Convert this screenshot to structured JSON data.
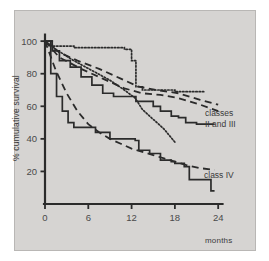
{
  "figure": {
    "background": "#ffffff",
    "panel_color": "#d6d4d2",
    "ink_color": "#2b2b2b"
  },
  "chart_data": {
    "type": "line",
    "title": "",
    "subtitle": "",
    "xlabel": "months",
    "ylabel": "% cumulative survival",
    "xlim": [
      0,
      25.5
    ],
    "ylim": [
      0,
      105
    ],
    "xticks": [
      0,
      6,
      12,
      18,
      24
    ],
    "xticklabels": [
      "0",
      "6",
      "12",
      "18",
      "24"
    ],
    "yticks": [
      20,
      40,
      60,
      80,
      100
    ],
    "yticklabels": [
      "20",
      "40",
      "60",
      "80",
      "100"
    ],
    "grid": false,
    "legend_position": "inline-annotations",
    "annotations": [
      {
        "text": "classes",
        "x": 22.3,
        "y": 62,
        "name": "classes-ii-and-iii-line1"
      },
      {
        "text": "II and III",
        "x": 22.3,
        "y": 57,
        "name": "classes-ii-and-iii-line2"
      },
      {
        "text": "class IV",
        "x": 22.2,
        "y": 21,
        "name": "class-iv-label"
      }
    ],
    "series": [
      {
        "name": "classes II and III — dashed upper",
        "style": "dashed",
        "step": false,
        "points": [
          [
            0,
            100
          ],
          [
            2.0,
            93
          ],
          [
            4.5,
            88
          ],
          [
            7.5,
            83
          ],
          [
            10.5,
            77
          ],
          [
            13.0,
            72
          ],
          [
            15.5,
            70
          ],
          [
            18.5,
            68
          ],
          [
            21.5,
            64
          ],
          [
            24.0,
            61
          ]
        ]
      },
      {
        "name": "classes II and III — dashed lower",
        "style": "dashed",
        "step": false,
        "points": [
          [
            0,
            100
          ],
          [
            2.0,
            90
          ],
          [
            5.0,
            83
          ],
          [
            8.0,
            77
          ],
          [
            11.0,
            71
          ],
          [
            13.5,
            68
          ],
          [
            16.0,
            67
          ],
          [
            18.5,
            65
          ],
          [
            21.5,
            61
          ],
          [
            24.0,
            57
          ]
        ]
      },
      {
        "name": "classes II and III — dotted plateau",
        "style": "dotted",
        "step": true,
        "points": [
          [
            0,
            100
          ],
          [
            1.0,
            97
          ],
          [
            4.0,
            96
          ],
          [
            9.0,
            96
          ],
          [
            11.0,
            95
          ],
          [
            12.0,
            88
          ],
          [
            12.6,
            72
          ],
          [
            13.5,
            70
          ],
          [
            16.0,
            70
          ],
          [
            18.0,
            69
          ],
          [
            20.5,
            69
          ],
          [
            22.0,
            69
          ]
        ]
      },
      {
        "name": "classes II and III — dotted descending",
        "style": "dotted",
        "step": false,
        "points": [
          [
            0,
            100
          ],
          [
            1.5,
            95
          ],
          [
            4.0,
            88
          ],
          [
            6.5,
            82
          ],
          [
            9.0,
            76
          ],
          [
            11.0,
            70
          ],
          [
            12.5,
            65
          ],
          [
            13.5,
            58
          ],
          [
            15.0,
            52
          ],
          [
            16.5,
            46
          ],
          [
            18.0,
            38
          ]
        ]
      },
      {
        "name": "classes II and III — solid step",
        "style": "solid",
        "step": true,
        "points": [
          [
            0,
            100
          ],
          [
            1.0,
            94
          ],
          [
            2.0,
            88
          ],
          [
            3.5,
            84
          ],
          [
            5.0,
            78
          ],
          [
            6.5,
            73
          ],
          [
            8.0,
            68
          ],
          [
            9.5,
            66
          ],
          [
            12.0,
            66
          ],
          [
            12.6,
            63
          ],
          [
            14.0,
            63
          ],
          [
            15.0,
            60
          ],
          [
            16.0,
            57
          ],
          [
            17.5,
            54
          ],
          [
            18.5,
            53
          ],
          [
            19.5,
            50
          ],
          [
            21.0,
            49
          ],
          [
            23.5,
            49
          ]
        ]
      },
      {
        "name": "class IV — dashed",
        "style": "dashed",
        "step": false,
        "points": [
          [
            0,
            100
          ],
          [
            1.5,
            82
          ],
          [
            3.0,
            68
          ],
          [
            4.5,
            57
          ],
          [
            6.0,
            49
          ],
          [
            7.5,
            44
          ],
          [
            9.0,
            40
          ],
          [
            10.5,
            37
          ],
          [
            12.0,
            34
          ],
          [
            13.5,
            32
          ],
          [
            15.0,
            30
          ],
          [
            16.5,
            28
          ],
          [
            18.0,
            26
          ],
          [
            19.5,
            24
          ],
          [
            21.5,
            22
          ],
          [
            23.5,
            21
          ]
        ]
      },
      {
        "name": "class IV — solid step",
        "style": "solid",
        "step": true,
        "points": [
          [
            0,
            100
          ],
          [
            0.8,
            80
          ],
          [
            1.6,
            66
          ],
          [
            2.4,
            57
          ],
          [
            3.2,
            50
          ],
          [
            4.0,
            47
          ],
          [
            6.5,
            47
          ],
          [
            7.0,
            44
          ],
          [
            8.5,
            44
          ],
          [
            9.0,
            40
          ],
          [
            10.0,
            40
          ],
          [
            11.5,
            40
          ],
          [
            12.5,
            39
          ],
          [
            13.0,
            33
          ],
          [
            14.5,
            31
          ],
          [
            15.5,
            31
          ],
          [
            16.0,
            27
          ],
          [
            17.5,
            26
          ],
          [
            18.0,
            25
          ],
          [
            19.0,
            25
          ],
          [
            19.3,
            23
          ],
          [
            20.0,
            15
          ],
          [
            22.0,
            15
          ],
          [
            23.0,
            8
          ],
          [
            23.5,
            8
          ]
        ]
      }
    ]
  },
  "axis": {
    "y_title": "% cumulative survival",
    "x_unit": "months"
  }
}
